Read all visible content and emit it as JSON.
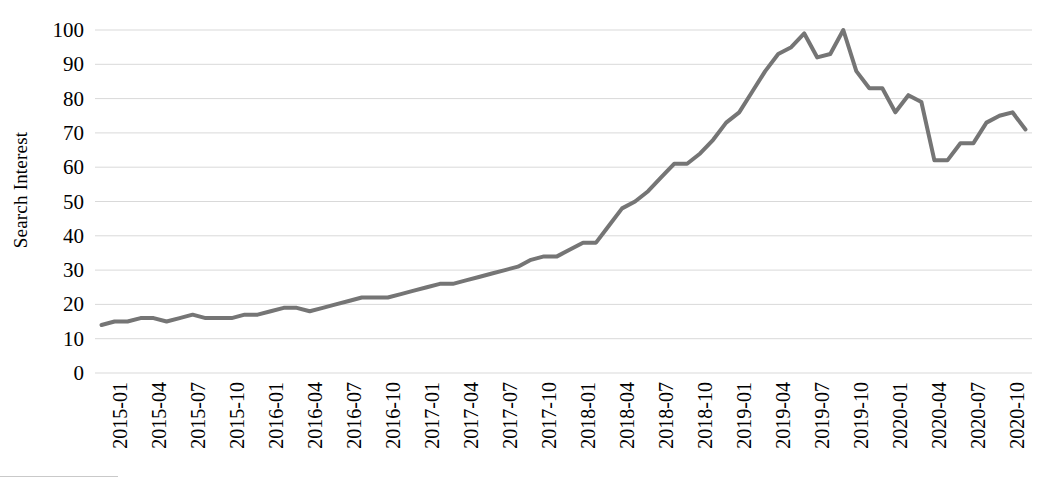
{
  "chart_data": {
    "type": "line",
    "title": "",
    "xlabel": "",
    "ylabel": "Search Interest",
    "ylim": [
      0,
      100
    ],
    "ytick_step": 10,
    "ytick_labels": [
      "100",
      "90",
      "80",
      "70",
      "60",
      "50",
      "40",
      "30",
      "20",
      "10",
      "0"
    ],
    "grid": true,
    "grid_axis": "y",
    "legend": "none",
    "line_color": "#757575",
    "line_width": 4,
    "xtick_labels": [
      "2015-01",
      "2015-04",
      "2015-07",
      "2015-10",
      "2016-01",
      "2016-04",
      "2016-07",
      "2016-10",
      "2017-01",
      "2017-04",
      "2017-07",
      "2017-10",
      "2018-01",
      "2018-04",
      "2018-07",
      "2018-10",
      "2019-01",
      "2019-04",
      "2019-07",
      "2019-10",
      "2020-01",
      "2020-04",
      "2020-07",
      "2020-10"
    ],
    "x": [
      "2015-01",
      "2015-02",
      "2015-03",
      "2015-04",
      "2015-05",
      "2015-06",
      "2015-07",
      "2015-08",
      "2015-09",
      "2015-10",
      "2015-11",
      "2015-12",
      "2016-01",
      "2016-02",
      "2016-03",
      "2016-04",
      "2016-05",
      "2016-06",
      "2016-07",
      "2016-08",
      "2016-09",
      "2016-10",
      "2016-11",
      "2016-12",
      "2017-01",
      "2017-02",
      "2017-03",
      "2017-04",
      "2017-05",
      "2017-06",
      "2017-07",
      "2017-08",
      "2017-09",
      "2017-10",
      "2017-11",
      "2017-12",
      "2018-01",
      "2018-02",
      "2018-03",
      "2018-04",
      "2018-05",
      "2018-06",
      "2018-07",
      "2018-08",
      "2018-09",
      "2018-10",
      "2018-11",
      "2018-12",
      "2019-01",
      "2019-02",
      "2019-03",
      "2019-04",
      "2019-05",
      "2019-06",
      "2019-07",
      "2019-08",
      "2019-09",
      "2019-10",
      "2019-11",
      "2019-12",
      "2020-01",
      "2020-02",
      "2020-03",
      "2020-04",
      "2020-05",
      "2020-06",
      "2020-07",
      "2020-08",
      "2020-09",
      "2020-10",
      "2020-11",
      "2020-12"
    ],
    "values": [
      14,
      15,
      15,
      16,
      16,
      15,
      16,
      17,
      16,
      16,
      16,
      17,
      17,
      18,
      19,
      19,
      18,
      19,
      20,
      21,
      22,
      22,
      22,
      23,
      24,
      25,
      26,
      26,
      27,
      28,
      29,
      30,
      31,
      33,
      34,
      34,
      36,
      38,
      38,
      43,
      48,
      50,
      53,
      57,
      61,
      61,
      64,
      68,
      73,
      76,
      82,
      88,
      93,
      95,
      99,
      92,
      93,
      100,
      88,
      83,
      83,
      76,
      81,
      79,
      62,
      62,
      67,
      67,
      73,
      75,
      76,
      71
    ],
    "series_name": "Search Interest"
  }
}
